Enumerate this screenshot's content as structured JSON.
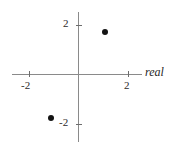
{
  "figure": {
    "type": "argand-diagram",
    "width": 174,
    "height": 148,
    "background": "#ffffff",
    "axis_color": "#8a8a8a",
    "point_color": "#131313",
    "text_color": "#2b2b2b"
  },
  "axes": {
    "real": {
      "name": "real",
      "ticks": [
        {
          "label": "-2",
          "value": -2
        },
        {
          "label": "2",
          "value": 2
        }
      ]
    },
    "imaginary": {
      "name": "",
      "ticks": [
        {
          "label": "2",
          "value": 2
        },
        {
          "label": "-2",
          "value": -2
        }
      ]
    }
  },
  "chart_data": {
    "type": "scatter",
    "title": "",
    "subtitle": "",
    "xlabel": "real",
    "ylabel": "",
    "xlim": [
      -2.7,
      2.6
    ],
    "ylim": [
      -2.6,
      2.6
    ],
    "xticks": [
      -2,
      2
    ],
    "xticklabels": [
      "-2",
      "2"
    ],
    "yticks": [
      -2,
      2
    ],
    "yticklabels": [
      "-2",
      "2"
    ],
    "grid": false,
    "legend": null,
    "annotations": [
      "real"
    ],
    "series": [
      {
        "name": "complex roots",
        "marker": "filled-circle",
        "color": "#131313",
        "points": [
          {
            "x": 1.05,
            "y": 1.73
          },
          {
            "x": -1.1,
            "y": -1.76
          }
        ]
      }
    ]
  }
}
